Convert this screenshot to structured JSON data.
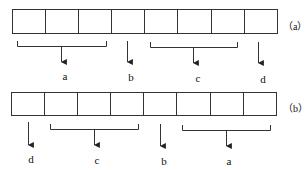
{
  "diagram": {
    "panels": [
      {
        "id": "a",
        "caption": "（a）",
        "cell_count": 8,
        "groups": [
          {
            "label": "a",
            "cells": [
              1,
              3
            ]
          },
          {
            "label": "b",
            "cells": [
              4,
              4
            ]
          },
          {
            "label": "c",
            "cells": [
              5,
              7
            ]
          },
          {
            "label": "d",
            "cells": [
              8,
              8
            ]
          }
        ]
      },
      {
        "id": "b",
        "caption": "（b）",
        "cell_count": 8,
        "groups": [
          {
            "label": "d",
            "cells": [
              1,
              1
            ]
          },
          {
            "label": "c",
            "cells": [
              2,
              4
            ]
          },
          {
            "label": "b",
            "cells": [
              5,
              5
            ]
          },
          {
            "label": "a",
            "cells": [
              6,
              8
            ]
          }
        ]
      }
    ],
    "colors": {
      "stroke": "#222222",
      "background": "#ffffff"
    }
  }
}
